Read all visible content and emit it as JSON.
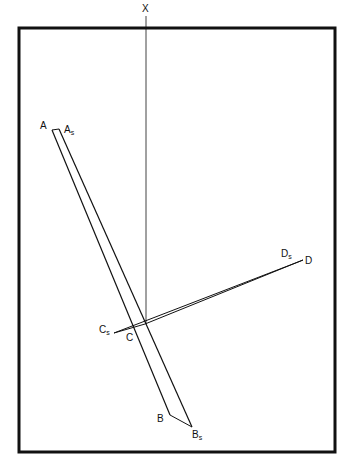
{
  "diagram": {
    "labels": {
      "x": "X",
      "a": "A",
      "as_main": "A",
      "as_sub": "s",
      "b": "B",
      "bs_main": "B",
      "bs_sub": "s",
      "c": "C",
      "cs_main": "C",
      "cs_sub": "s",
      "d": "D",
      "ds_main": "D",
      "ds_sub": "s"
    },
    "colors": {
      "stroke": "#111111",
      "background": "#ffffff"
    }
  }
}
